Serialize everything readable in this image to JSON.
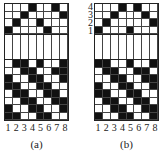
{
  "panels": [
    {
      "id": "a",
      "caption": "(a)",
      "y_labels": [],
      "x_labels": [
        "1",
        "2",
        "3",
        "4",
        "5",
        "6",
        "7",
        "8"
      ],
      "top_rows": [
        [
          0,
          0,
          0,
          1,
          0,
          0,
          1,
          0
        ],
        [
          0,
          0,
          1,
          0,
          0,
          0,
          0,
          1
        ],
        [
          0,
          1,
          0,
          0,
          1,
          0,
          0,
          0
        ],
        [
          1,
          0,
          0,
          0,
          0,
          1,
          0,
          0
        ]
      ],
      "bottom_rows": [
        [
          0,
          1,
          1,
          0,
          1,
          0,
          0,
          1
        ],
        [
          0,
          0,
          1,
          1,
          0,
          0,
          1,
          1
        ],
        [
          1,
          0,
          0,
          1,
          1,
          0,
          0,
          1
        ],
        [
          1,
          1,
          0,
          0,
          1,
          1,
          0,
          0
        ],
        [
          0,
          1,
          1,
          0,
          0,
          1,
          1,
          0
        ],
        [
          0,
          0,
          1,
          1,
          0,
          0,
          1,
          1
        ],
        [
          1,
          0,
          0,
          1,
          1,
          0,
          0,
          1
        ],
        [
          1,
          1,
          0,
          0,
          1,
          1,
          0,
          0
        ]
      ]
    },
    {
      "id": "b",
      "caption": "(b)",
      "y_labels": [
        "4",
        "3",
        "2",
        "1"
      ],
      "x_labels": [
        "1",
        "2",
        "3",
        "4",
        "5",
        "6",
        "7",
        "8"
      ],
      "top_rows": [
        [
          0,
          0,
          0,
          1,
          0,
          1,
          0,
          0
        ],
        [
          0,
          0,
          1,
          0,
          0,
          0,
          1,
          0
        ],
        [
          0,
          1,
          0,
          0,
          0,
          0,
          0,
          1
        ],
        [
          1,
          0,
          0,
          0,
          1,
          0,
          0,
          0
        ]
      ],
      "bottom_rows": [
        [
          1,
          1,
          0,
          0,
          1,
          0,
          0,
          1
        ],
        [
          0,
          1,
          1,
          0,
          0,
          1,
          1,
          0
        ],
        [
          0,
          0,
          1,
          1,
          0,
          0,
          1,
          1
        ],
        [
          1,
          0,
          0,
          1,
          1,
          0,
          0,
          1
        ],
        [
          1,
          1,
          0,
          0,
          1,
          1,
          0,
          0
        ],
        [
          0,
          1,
          1,
          0,
          0,
          1,
          1,
          0
        ],
        [
          0,
          0,
          1,
          1,
          0,
          0,
          1,
          1
        ],
        [
          1,
          0,
          0,
          1,
          1,
          0,
          0,
          1
        ]
      ]
    }
  ],
  "colors": {
    "filled": "#111111",
    "empty": "#ffffff",
    "line": "#444444"
  }
}
